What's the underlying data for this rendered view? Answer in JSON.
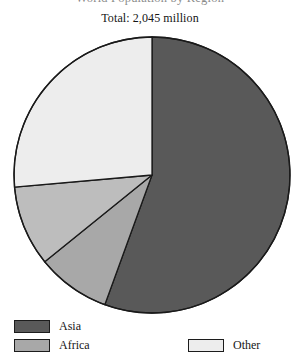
{
  "chart_data": {
    "type": "pie",
    "title": "World Population by Region",
    "subtitle": "Total: 2,045 million",
    "categories": [
      "Asia",
      "Africa",
      "Slice 3",
      "Other"
    ],
    "values": [
      55.6,
      8.6,
      9.4,
      26.4
    ],
    "colors": [
      "#595959",
      "#a8a8a8",
      "#bdbdbd",
      "#ededed"
    ],
    "start_angle_deg": 0,
    "direction": "clockwise",
    "legend_position": "bottom",
    "grid": false,
    "xlabel": "",
    "ylabel": "",
    "slices": [
      {
        "label": "Asia",
        "start_deg": 0,
        "end_deg": 200.0,
        "color": "#595959",
        "percent": 55.6
      },
      {
        "label": "Africa",
        "start_deg": 200.0,
        "end_deg": 231.0,
        "color": "#a8a8a8",
        "percent": 8.6
      },
      {
        "label": "Slice 3",
        "start_deg": 231.0,
        "end_deg": 265.0,
        "color": "#bdbdbd",
        "percent": 9.4
      },
      {
        "label": "Other",
        "start_deg": 265.0,
        "end_deg": 360.0,
        "color": "#ededed",
        "percent": 26.4
      }
    ],
    "geometry": {
      "cx": 152,
      "cy": 175,
      "r": 138
    }
  },
  "chart": {
    "title": "World Population by Region",
    "subtitle": "Total: 2,045 million"
  },
  "legend": {
    "columns": [
      {
        "items": [
          {
            "label": "Asia",
            "color": "#595959"
          },
          {
            "label": "Africa",
            "color": "#a8a8a8"
          }
        ]
      },
      {
        "items": [
          {
            "label": "Other",
            "color": "#ededed"
          }
        ]
      }
    ]
  }
}
